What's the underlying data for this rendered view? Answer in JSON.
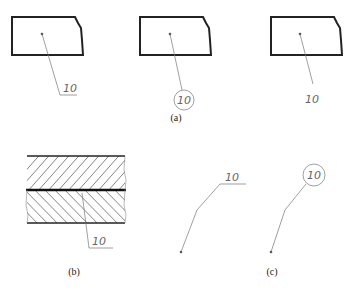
{
  "figure": {
    "panel_a": {
      "caption": "(a)",
      "items": [
        {
          "label": "10",
          "style": "underlined"
        },
        {
          "label": "10",
          "style": "circled"
        },
        {
          "label": "10",
          "style": "plain"
        }
      ]
    },
    "panel_b": {
      "caption": "(b)",
      "label": "10",
      "style": "underlined"
    },
    "panel_c": {
      "caption": "(c)",
      "items": [
        {
          "label": "10",
          "style": "underlined"
        },
        {
          "label": "10",
          "style": "circled"
        }
      ]
    }
  },
  "colors": {
    "outline": "#222222",
    "leader": "#777777",
    "text": "#666666"
  }
}
